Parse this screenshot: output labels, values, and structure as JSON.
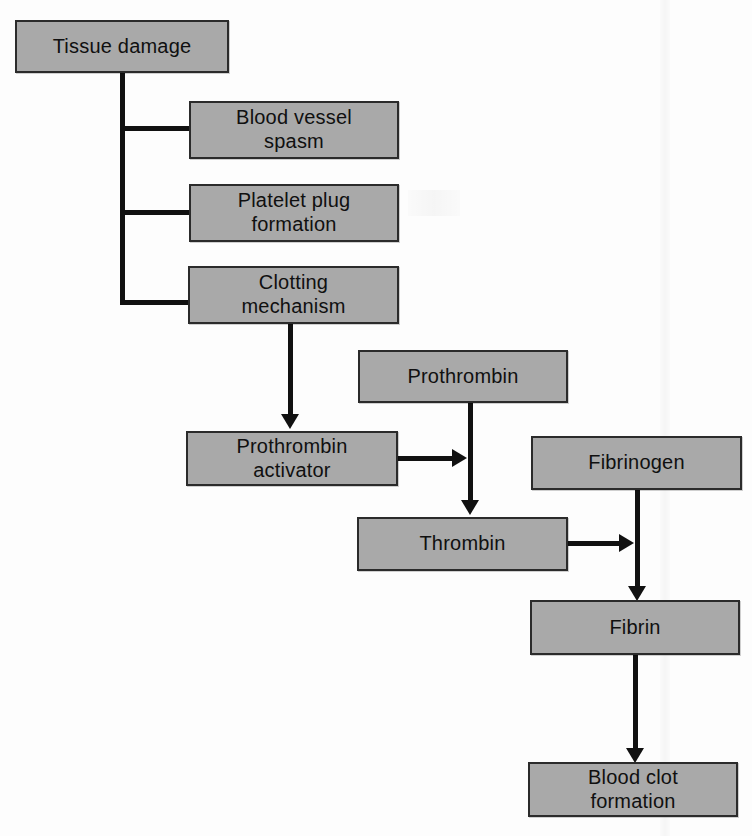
{
  "diagram": {
    "type": "flowchart",
    "style": {
      "node_fill": "#a9a9a9",
      "node_border": "#2b2b2b",
      "connector": "#111111",
      "background": "#fdfdfd",
      "text_color": "#101010"
    },
    "nodes": [
      {
        "id": "tissue-damage",
        "label": "Tissue damage",
        "x": 15,
        "y": 20,
        "w": 214,
        "h": 53
      },
      {
        "id": "blood-vessel-spasm",
        "label": "Blood vessel\nspasm",
        "x": 189,
        "y": 101,
        "w": 210,
        "h": 58
      },
      {
        "id": "platelet-plug",
        "label": "Platelet plug\nformation",
        "x": 189,
        "y": 184,
        "w": 210,
        "h": 58
      },
      {
        "id": "clotting-mechanism",
        "label": "Clotting\nmechanism",
        "x": 188,
        "y": 266,
        "w": 211,
        "h": 58
      },
      {
        "id": "prothrombin",
        "label": "Prothrombin",
        "x": 358,
        "y": 350,
        "w": 210,
        "h": 53
      },
      {
        "id": "prothrombin-activator",
        "label": "Prothrombin\nactivator",
        "x": 186,
        "y": 431,
        "w": 212,
        "h": 55
      },
      {
        "id": "fibrinogen",
        "label": "Fibrinogen",
        "x": 531,
        "y": 436,
        "w": 211,
        "h": 54
      },
      {
        "id": "thrombin",
        "label": "Thrombin",
        "x": 357,
        "y": 517,
        "w": 211,
        "h": 54
      },
      {
        "id": "fibrin",
        "label": "Fibrin",
        "x": 530,
        "y": 600,
        "w": 210,
        "h": 55
      },
      {
        "id": "blood-clot-formation",
        "label": "Blood clot\nformation",
        "x": 528,
        "y": 762,
        "w": 210,
        "h": 55
      }
    ],
    "edges": [
      {
        "id": "tissue-to-spasm",
        "from": "tissue-damage",
        "to": "blood-vessel-spasm",
        "arrow": false
      },
      {
        "id": "tissue-to-platelet",
        "from": "tissue-damage",
        "to": "platelet-plug",
        "arrow": false
      },
      {
        "id": "tissue-to-clotting",
        "from": "tissue-damage",
        "to": "clotting-mechanism",
        "arrow": false
      },
      {
        "id": "clotting-to-activator",
        "from": "clotting-mechanism",
        "to": "prothrombin-activator",
        "arrow": true
      },
      {
        "id": "prothrombin-to-thrombin",
        "from": "prothrombin",
        "to": "thrombin",
        "arrow": true
      },
      {
        "id": "activator-to-prothrombin",
        "from": "prothrombin-activator",
        "to": "prothrombin-to-thrombin",
        "arrow": true
      },
      {
        "id": "fibrinogen-to-fibrin",
        "from": "fibrinogen",
        "to": "fibrin",
        "arrow": true
      },
      {
        "id": "thrombin-to-fibrinogen-line",
        "from": "thrombin",
        "to": "fibrinogen-to-fibrin",
        "arrow": true
      },
      {
        "id": "fibrin-to-blood-clot",
        "from": "fibrin",
        "to": "blood-clot-formation",
        "arrow": true
      }
    ]
  }
}
